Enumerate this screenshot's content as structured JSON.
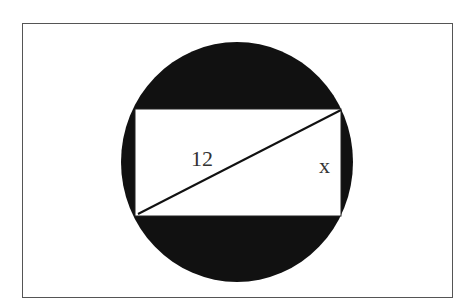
{
  "diagram": {
    "type": "geometry",
    "labels": {
      "diagonal": "12",
      "side": "x"
    },
    "colors": {
      "circle_fill": "#111111",
      "rectangle_fill": "#ffffff",
      "border": "#555555",
      "line": "#111111"
    }
  }
}
